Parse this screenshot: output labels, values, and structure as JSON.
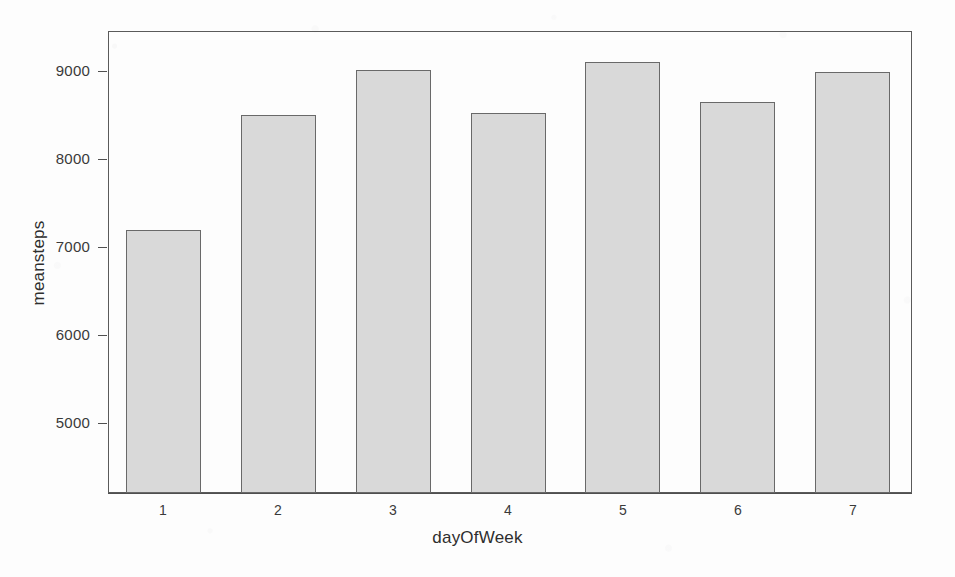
{
  "chart_data": {
    "type": "bar",
    "title": "",
    "subtitle": "",
    "xlabel": "dayOfWeek",
    "ylabel": "meansteps",
    "categories": [
      "1",
      "2",
      "3",
      "4",
      "5",
      "6",
      "7"
    ],
    "values": [
      7190,
      8500,
      9010,
      8520,
      9100,
      8650,
      8990
    ],
    "series": [
      {
        "name": "meansteps",
        "values": [
          7190,
          8500,
          9010,
          8520,
          9100,
          8650,
          8990
        ]
      }
    ],
    "ytick_labels": [
      "5000",
      "6000",
      "7000",
      "8000",
      "9000"
    ],
    "ytick_values": [
      5000,
      6000,
      7000,
      8000,
      9000
    ],
    "xtick_labels": [
      "1",
      "2",
      "3",
      "4",
      "5",
      "6",
      "7"
    ],
    "ylim": [
      4210,
      9450
    ],
    "xlim": [
      0,
      7
    ],
    "grid": false,
    "legend": false,
    "legend_position": "none",
    "bar_fill_color": "#d9d9d9",
    "bar_border_color": "#696969",
    "axis_color": "#4f4f4f",
    "text_color": "#3a3a3a",
    "background_color": "#fdfdfd"
  },
  "figure": {
    "xlab_text": "dayOfWeek",
    "ylab_text": "meansteps"
  }
}
